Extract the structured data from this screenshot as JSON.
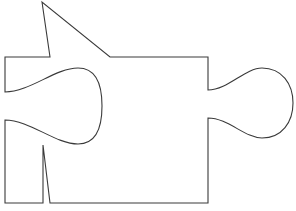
{
  "document": {
    "title": "Puzzle Piece Outline",
    "background_color": "#ffffff"
  },
  "figure": {
    "name": "jigsaw-puzzle-piece",
    "stroke_color": "#3a3a3a",
    "fill_color": "#ffffff",
    "stroke_width": "1.1",
    "canvas": {
      "width": 296,
      "height": 211
    },
    "features": [
      "top-left triangular spike",
      "left inward rounded tab",
      "right outward rounded tab",
      "bottom-left triangular notch",
      "straight top edge",
      "straight bottom edge"
    ],
    "path": "M 42 2 L 50 57 L 5 57 L 5 92 C 30 92 55 68 78 68 C 98 68 102 88 102 106 C 102 124 98 144 78 144 C 55 144 30 120 5 120 L 5 203 L 43 203 L 43 145 L 50 203 L 110 203 L 208 203 L 208 118 C 228 118 245 138 262 138 C 282 138 293 122 293 103 C 293 84 282 68 262 68 C 245 68 228 90 208 90 L 208 57 L 110 57 Z"
  }
}
